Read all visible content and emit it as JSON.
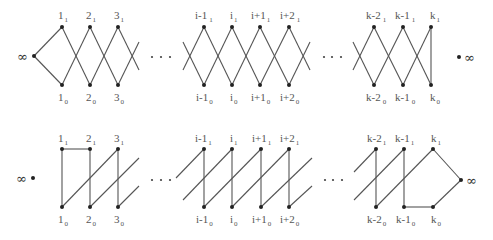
{
  "diagram": {
    "colors": {
      "edge": "#555555",
      "node": "#222222",
      "label": "#555555"
    },
    "rows": [
      {
        "id": "top",
        "infinity_label": "∞",
        "infinity_side_left": "∞",
        "infinity_side_right": "∞",
        "ellipsis": "· · ·",
        "columns": [
          {
            "base": "1",
            "top_sub": "1",
            "bottom_sub": "0"
          },
          {
            "base": "2",
            "top_sub": "1",
            "bottom_sub": "0"
          },
          {
            "base": "3",
            "top_sub": "1",
            "bottom_sub": "0"
          },
          {
            "base": "i-1",
            "top_sub": "1",
            "bottom_sub": "0"
          },
          {
            "base": "i",
            "top_sub": "1",
            "bottom_sub": "0"
          },
          {
            "base": "i+1",
            "top_sub": "1",
            "bottom_sub": "0"
          },
          {
            "base": "i+2",
            "top_sub": "1",
            "bottom_sub": "0"
          },
          {
            "base": "k-2",
            "top_sub": "1",
            "bottom_sub": "0"
          },
          {
            "base": "k-1",
            "top_sub": "1",
            "bottom_sub": "0"
          },
          {
            "base": "k",
            "top_sub": "1",
            "bottom_sub": "0"
          }
        ]
      },
      {
        "id": "bottom",
        "infinity_label": "∞",
        "ellipsis": "· · ·",
        "columns": [
          {
            "base": "1",
            "top_sub": "1",
            "bottom_sub": "0"
          },
          {
            "base": "2",
            "top_sub": "1",
            "bottom_sub": "0"
          },
          {
            "base": "3",
            "top_sub": "1",
            "bottom_sub": "0"
          },
          {
            "base": "i-1",
            "top_sub": "1",
            "bottom_sub": "0"
          },
          {
            "base": "i",
            "top_sub": "1",
            "bottom_sub": "0"
          },
          {
            "base": "i+1",
            "top_sub": "1",
            "bottom_sub": "0"
          },
          {
            "base": "i+2",
            "top_sub": "1",
            "bottom_sub": "0"
          },
          {
            "base": "k-2",
            "top_sub": "1",
            "bottom_sub": "0"
          },
          {
            "base": "k-1",
            "top_sub": "1",
            "bottom_sub": "0"
          },
          {
            "base": "k",
            "top_sub": "1",
            "bottom_sub": "0"
          }
        ]
      }
    ]
  }
}
